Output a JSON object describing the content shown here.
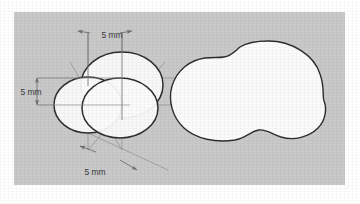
{
  "figure": {
    "panel": {
      "background_color": "#c9c9c9",
      "x": 14,
      "y": 12,
      "width": 331,
      "height": 173
    },
    "colors": {
      "panel_gray": "#c9c9c9",
      "shape_fill": "#fbfbfb",
      "shape_stroke": "#2e2e2e",
      "construction_line": "#8a8a8a",
      "dimension_line": "#6f6f6f",
      "label_text": "#3b3b3b",
      "page_white": "#ffffff"
    },
    "left_diagram": {
      "name": "construction-diagram",
      "circles": [
        {
          "id": "top-circle",
          "cx": 122,
          "cy": 85,
          "rx": 41,
          "ry": 33
        },
        {
          "id": "left-circle",
          "cx": 88,
          "cy": 105,
          "rx": 34,
          "ry": 28
        },
        {
          "id": "bottom-circle",
          "cx": 120,
          "cy": 108,
          "rx": 38,
          "ry": 30
        }
      ],
      "dimensions": [
        {
          "id": "dim-top",
          "label": "5 mm",
          "orientation": "horizontal",
          "label_x": 112,
          "label_y": 35
        },
        {
          "id": "dim-left",
          "label": "5 mm",
          "orientation": "vertical",
          "label_x": 31,
          "label_y": 100
        },
        {
          "id": "dim-bottom",
          "label": "5 mm",
          "orientation": "diagonal",
          "label_x": 95,
          "label_y": 172
        }
      ]
    },
    "right_diagram": {
      "name": "union-outline-diagram",
      "description": "Union (outer boundary) of the three overlapping circles",
      "bounds": {
        "x": 214,
        "y": 41,
        "width": 112,
        "height": 100
      }
    },
    "top_text_remnant": "........ ......... ..... ....."
  }
}
